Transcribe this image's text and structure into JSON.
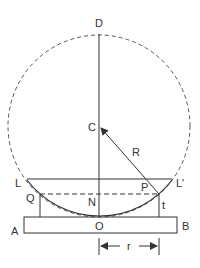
{
  "diagram": {
    "colors": {
      "stroke": "#333333",
      "background": "#ffffff"
    },
    "labels": {
      "D": "D",
      "C": "C",
      "R": "R",
      "L": "L",
      "L_prime": "L′",
      "P": "P",
      "Q": "Q",
      "N": "N",
      "t": "t",
      "A": "A",
      "O": "O",
      "B": "B",
      "r": "r"
    }
  }
}
